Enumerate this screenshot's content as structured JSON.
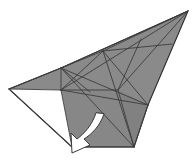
{
  "figure": {
    "background_color": "#ffffff",
    "canvas": {
      "width": 195,
      "height": 162
    }
  },
  "palette": {
    "paper_front_grey": "#8a8a8a",
    "paper_front_grey_dark": "#7e7e7e",
    "paper_front_grey_light": "#949494",
    "paper_back_white": "#ffffff",
    "crease_line": "#3c3c3c",
    "outline": "#2b2b2b",
    "arrow_fill": "#ffffff",
    "arrow_stroke": "#3a3a3a"
  },
  "shapes": {
    "main_body": {
      "name": "large-grey-kite-panel",
      "fill": "#8a8a8a",
      "outline_points": "61,68 103,51 188,11 148,105 134,147 61,90"
    },
    "upper_wing": {
      "name": "upper-grey-wing",
      "fill": "#8d8d8d",
      "outline_points": "61,68 188,11 103,51"
    },
    "right_lower_facet": {
      "name": "right-lower-grey-facet",
      "fill": "#828282",
      "outline_points": "148,105 134,147 118,90"
    },
    "left_grey_flap": {
      "name": "left-grey-upper-flap",
      "fill": "#8a8a8a",
      "outline_points": "9,89 61,68 61,90"
    },
    "left_white_flap": {
      "name": "left-white-under-flap",
      "fill": "#ffffff",
      "outline_points": "9,89 61,90 72,147"
    },
    "lower_grey_band": {
      "name": "lower-grey-band",
      "fill": "#878787",
      "outline_points": "61,90 118,90 134,147 72,147"
    }
  },
  "creases": [
    {
      "name": "crease-top-long-edge",
      "from": "61,68",
      "to": "188,11"
    },
    {
      "name": "crease-upper-diagonal",
      "from": "103,51",
      "to": "188,11"
    },
    {
      "name": "crease-body-left-edge",
      "from": "61,68",
      "to": "61,90"
    },
    {
      "name": "crease-horizontal-mid",
      "from": "61,90",
      "to": "118,90"
    },
    {
      "name": "crease-horizontal-upper",
      "from": "103,51",
      "to": "170,44"
    },
    {
      "name": "crease-diagonal-a",
      "from": "61,68",
      "to": "148,105"
    },
    {
      "name": "crease-diagonal-b",
      "from": "61,68",
      "to": "134,147"
    },
    {
      "name": "crease-diagonal-c",
      "from": "61,90",
      "to": "188,11"
    },
    {
      "name": "crease-diagonal-d",
      "from": "103,51",
      "to": "134,147"
    },
    {
      "name": "crease-diagonal-e",
      "from": "118,90",
      "to": "188,11"
    },
    {
      "name": "crease-diagonal-f",
      "from": "61,90",
      "to": "118,90"
    },
    {
      "name": "crease-x-cross-1",
      "from": "103,51",
      "to": "148,105"
    },
    {
      "name": "crease-x-cross-2",
      "from": "141,39",
      "to": "118,90"
    },
    {
      "name": "crease-lower-left-fold",
      "from": "61,90",
      "to": "72,147"
    },
    {
      "name": "crease-bottom-edge",
      "from": "72,147",
      "to": "134,147"
    },
    {
      "name": "crease-right-edge",
      "from": "148,105",
      "to": "134,147"
    },
    {
      "name": "crease-white-flap-top",
      "from": "9,89",
      "to": "61,90"
    },
    {
      "name": "crease-white-flap-bottom",
      "from": "9,89",
      "to": "72,147"
    },
    {
      "name": "crease-grey-flap-top",
      "from": "9,89",
      "to": "61,68"
    },
    {
      "name": "crease-inner-left-v",
      "from": "61,68",
      "to": "88,90"
    },
    {
      "name": "crease-inner-small",
      "from": "61,90",
      "to": "103,51"
    }
  ],
  "arrow": {
    "name": "fold-direction-arrow",
    "style": "curved-solid-white-arrow",
    "direction": "down-left",
    "fill": "#ffffff",
    "stroke": "#3a3a3a",
    "tail_point": "100,118",
    "head_point": "74,152",
    "label": ""
  },
  "annotations": {
    "step_number": "",
    "caption": ""
  }
}
